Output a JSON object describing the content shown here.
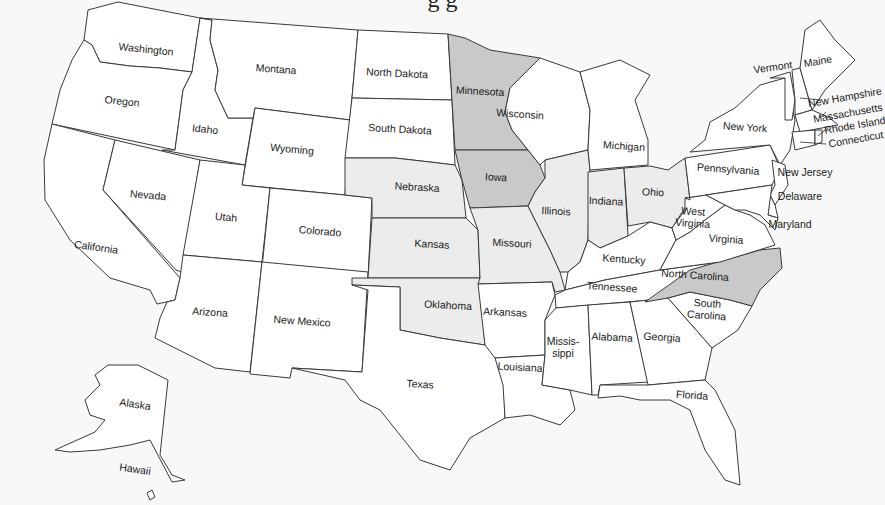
{
  "title_partial": "g                g",
  "legend_colors": {
    "none": "#ffffff",
    "light": "#ececec",
    "dark": "#c9c9c9",
    "background": "#f8f8f8",
    "border": "#3a3a3a"
  },
  "states": [
    {
      "id": "WA",
      "name": "Washington",
      "shade": "none",
      "lx": 146,
      "ly": 50,
      "rot": 6,
      "pts": "88,10 118,2 200,18 192,72 160,68 130,66 100,62 92,45 84,40"
    },
    {
      "id": "OR",
      "name": "Oregon",
      "shade": "none",
      "lx": 122,
      "ly": 102,
      "rot": 6,
      "pts": "84,40 92,45 100,62 130,66 160,68 192,72 183,90 175,150 52,124 60,90 72,60"
    },
    {
      "id": "CA",
      "name": "California",
      "shade": "none",
      "lx": 96,
      "ly": 248,
      "rot": 8,
      "pts": "52,124 115,140 103,190 180,278 175,300 157,304 150,290 110,278 70,240 45,200 44,160"
    },
    {
      "id": "ID",
      "name": "Idaho",
      "shade": "none",
      "lx": 205,
      "ly": 130,
      "rot": 6,
      "pts": "192,72 200,18 212,20 210,40 218,70 215,90 228,118 253,118 245,165 162,150 175,150 183,90"
    },
    {
      "id": "NV",
      "name": "Nevada",
      "shade": "none",
      "lx": 148,
      "ly": 196,
      "rot": 5,
      "pts": "115,140 200,160 182,272 176,270 103,190"
    },
    {
      "id": "MT",
      "name": "Montana",
      "shade": "none",
      "lx": 276,
      "ly": 70,
      "rot": 4,
      "pts": "200,18 358,30 350,120 255,108 253,118 228,118 215,90 218,70 210,40 212,20"
    },
    {
      "id": "WY",
      "name": "Wyoming",
      "shade": "none",
      "lx": 292,
      "ly": 150,
      "rot": 5,
      "pts": "255,108 350,120 345,195 242,185"
    },
    {
      "id": "UT",
      "name": "Utah",
      "shade": "none",
      "lx": 226,
      "ly": 218,
      "rot": 5,
      "pts": "200,160 245,165 242,185 270,188 262,262 183,255"
    },
    {
      "id": "CO",
      "name": "Colorado",
      "shade": "none",
      "lx": 320,
      "ly": 232,
      "rot": 5,
      "pts": "270,188 345,195 372,198 368,278 262,268"
    },
    {
      "id": "AZ",
      "name": "Arizona",
      "shade": "none",
      "lx": 210,
      "ly": 313,
      "rot": 4,
      "pts": "183,255 262,262 250,372 215,368 155,338 160,318 167,302 175,300 180,278"
    },
    {
      "id": "NM",
      "name": "New Mexico",
      "shade": "none",
      "lx": 302,
      "ly": 322,
      "rot": 4,
      "pts": "262,262 368,272 362,372 292,368 290,378 250,374"
    },
    {
      "id": "ND",
      "name": "North Dakota",
      "shade": "none",
      "lx": 397,
      "ly": 74,
      "rot": 3,
      "pts": "358,30 448,34 452,100 352,98"
    },
    {
      "id": "SD",
      "name": "South Dakota",
      "shade": "none",
      "lx": 400,
      "ly": 130,
      "rot": 3,
      "pts": "352,98 452,100 455,165 430,162 395,158 345,158"
    },
    {
      "id": "NE",
      "name": "Nebraska",
      "shade": "light",
      "lx": 417,
      "ly": 188,
      "rot": 3,
      "pts": "345,158 395,158 430,162 455,165 462,180 466,218 372,218 372,198 345,195"
    },
    {
      "id": "KS",
      "name": "Kansas",
      "shade": "light",
      "lx": 432,
      "ly": 245,
      "rot": 3,
      "pts": "372,218 466,218 478,230 480,278 368,278"
    },
    {
      "id": "OK",
      "name": "Oklahoma",
      "shade": "light",
      "lx": 448,
      "ly": 306,
      "rot": 3,
      "pts": "352,278 480,278 485,345 440,338 400,330 400,287 352,285"
    },
    {
      "id": "TX",
      "name": "Texas",
      "shade": "none",
      "lx": 420,
      "ly": 385,
      "rot": 3,
      "pts": "352,285 400,287 400,330 440,338 485,345 503,350 505,418 470,438 450,470 420,460 380,410 360,400 345,380 292,368 362,372 368,290"
    },
    {
      "id": "MN",
      "name": "Minnesota",
      "shade": "dark",
      "lx": 480,
      "ly": 92,
      "rot": 3,
      "pts": "448,34 465,38 490,50 540,58 510,88 505,112 512,130 528,150 455,150 452,100"
    },
    {
      "id": "IA",
      "name": "Iowa",
      "shade": "dark",
      "lx": 496,
      "ly": 178,
      "rot": 3,
      "pts": "455,150 528,150 540,165 545,178 535,192 528,206 470,208 462,180"
    },
    {
      "id": "MO",
      "name": "Missouri",
      "shade": "light",
      "lx": 512,
      "ly": 244,
      "rot": 3,
      "pts": "470,208 528,206 540,230 550,250 560,272 565,290 555,292 552,282 478,284 480,278 478,230"
    },
    {
      "id": "AR",
      "name": "Arkansas",
      "shade": "none",
      "lx": 505,
      "ly": 313,
      "rot": 3,
      "pts": "478,284 552,282 555,295 545,320 545,355 495,358 485,345"
    },
    {
      "id": "LA",
      "name": "Louisiana",
      "shade": "none",
      "lx": 520,
      "ly": 368,
      "rot": 3,
      "pts": "495,358 545,355 542,385 570,390 575,410 560,425 530,415 505,418 503,385"
    },
    {
      "id": "WI",
      "name": "Wisconsin",
      "shade": "none",
      "lx": 520,
      "ly": 115,
      "rot": 4,
      "pts": "510,88 540,58 580,72 590,110 588,150 545,160 540,165 528,150 512,130 505,112"
    },
    {
      "id": "IL",
      "name": "Illinois",
      "shade": "light",
      "lx": 556,
      "ly": 212,
      "rot": 3,
      "pts": "545,160 588,150 590,170 588,240 580,262 568,272 560,272 550,250 540,230 528,206 535,192 545,178"
    },
    {
      "id": "MI",
      "name": "Michigan",
      "shade": "none",
      "lx": 624,
      "ly": 147,
      "rot": 4,
      "pts": "580,72 620,60 650,75 635,100 648,140 648,165 590,170 588,150 590,110"
    },
    {
      "id": "IN",
      "name": "Indiana",
      "shade": "light",
      "lx": 606,
      "ly": 202,
      "rot": 3,
      "pts": "588,172 624,168 628,236 600,248 588,240"
    },
    {
      "id": "OH",
      "name": "Ohio",
      "shade": "light",
      "lx": 653,
      "ly": 193,
      "rot": 3,
      "pts": "624,168 650,166 668,170 685,158 690,200 672,228 650,222 628,226"
    },
    {
      "id": "KY",
      "name": "Kentucky",
      "shade": "none",
      "lx": 624,
      "ly": 260,
      "rot": 4,
      "pts": "588,240 600,248 628,236 650,222 672,228 676,240 660,270 605,280 565,290 568,272 580,262"
    },
    {
      "id": "TN",
      "name": "Tennessee",
      "shade": "none",
      "lx": 612,
      "ly": 288,
      "rot": 4,
      "pts": "565,290 605,280 660,270 720,262 690,285 650,300 556,308 555,295"
    },
    {
      "id": "MS",
      "name": "Mississippi",
      "shade": "none",
      "lx": 563,
      "ly": 348,
      "rot": 0,
      "pts": "556,308 588,305 592,395 570,390 542,385 545,355 545,320"
    },
    {
      "id": "AL",
      "name": "Alabama",
      "shade": "none",
      "lx": 612,
      "ly": 338,
      "rot": 3,
      "pts": "588,305 630,302 648,382 600,385 598,395 592,395"
    },
    {
      "id": "GA",
      "name": "Georgia",
      "shade": "none",
      "lx": 662,
      "ly": 338,
      "rot": 4,
      "pts": "630,302 668,298 712,348 705,380 648,385"
    },
    {
      "id": "FL",
      "name": "Florida",
      "shade": "none",
      "lx": 692,
      "ly": 396,
      "rot": 4,
      "pts": "600,385 648,385 705,380 715,390 735,430 740,485 725,480 705,450 690,410 670,400 640,400 620,396 598,398"
    },
    {
      "id": "SC",
      "name": "South Carolina",
      "shade": "none",
      "lx": 707,
      "ly": 310,
      "rot": 4,
      "pts": "668,298 690,292 730,300 752,306 738,330 712,348"
    },
    {
      "id": "NC",
      "name": "North Carolina",
      "shade": "dark",
      "lx": 695,
      "ly": 276,
      "rot": 4,
      "pts": "645,302 690,270 760,250 780,248 782,268 760,290 752,306 730,300 690,292 668,298"
    },
    {
      "id": "VA",
      "name": "Virginia",
      "shade": "none",
      "lx": 726,
      "ly": 240,
      "rot": 4,
      "pts": "660,270 676,240 690,232 705,220 725,205 735,210 750,215 765,225 775,245 720,262"
    },
    {
      "id": "WV",
      "name": "West Virginia",
      "shade": "none",
      "lx": 693,
      "ly": 218,
      "rot": 4,
      "pts": "676,240 672,228 685,210 685,198 706,195 725,205 705,220 690,232"
    },
    {
      "id": "PA",
      "name": "Pennsylvania",
      "shade": "none",
      "lx": 728,
      "ly": 170,
      "rot": 4,
      "pts": "685,158 770,145 780,168 772,185 706,195 685,198 690,200"
    },
    {
      "id": "NY",
      "name": "New York",
      "shade": "none",
      "lx": 745,
      "ly": 128,
      "rot": 4,
      "pts": "690,152 705,140 710,122 735,108 760,85 785,78 795,120 790,150 780,165 770,145"
    },
    {
      "id": "NJ",
      "name": "New Jersey",
      "shade": "none",
      "lx": 805,
      "ly": 173,
      "rot": 0,
      "pts": "772,160 785,165 788,185 775,205 770,195 775,185"
    },
    {
      "id": "DE",
      "name": "Delaware",
      "shade": "none",
      "lx": 800,
      "ly": 197,
      "rot": 0,
      "pts": "770,195 775,205 778,218 768,215"
    },
    {
      "id": "MD",
      "name": "Maryland",
      "shade": "none",
      "lx": 790,
      "ly": 225,
      "rot": 0,
      "pts": "706,195 772,185 768,215 778,218 775,230 760,215 745,210 735,210 725,205"
    },
    {
      "id": "VT",
      "name": "Vermont",
      "shade": "none",
      "lx": 773,
      "ly": 68,
      "rot": -8,
      "pts": "770,78 790,72 795,100 792,120 785,120 785,78"
    },
    {
      "id": "NH",
      "name": "New Hampshire",
      "shade": "none",
      "lx": 845,
      "ly": 98,
      "rot": -10,
      "pts": "792,70 800,68 812,110 795,115 795,100"
    },
    {
      "id": "ME",
      "name": "Maine",
      "shade": "none",
      "lx": 818,
      "ly": 62,
      "rot": -10,
      "pts": "800,68 805,30 820,20 835,40 855,60 840,75 825,90 812,110"
    },
    {
      "id": "MA",
      "name": "Massachusetts",
      "shade": "none",
      "lx": 848,
      "ly": 114,
      "rot": -10,
      "pts": "795,115 812,110 830,118 838,125 800,132"
    },
    {
      "id": "CT",
      "name": "Connecticut",
      "shade": "none",
      "lx": 856,
      "ly": 140,
      "rot": -10,
      "pts": "792,132 815,130 815,145 795,150"
    },
    {
      "id": "RI",
      "name": "Rhode Island",
      "shade": "none",
      "lx": 855,
      "ly": 126,
      "rot": -10,
      "pts": "815,130 822,130 822,142 815,145"
    },
    {
      "id": "AK",
      "name": "Alaska",
      "shade": "none",
      "lx": 135,
      "ly": 405,
      "rot": 8,
      "pts": "108,365 138,365 168,380 160,455 172,475 185,480 172,482 150,440 130,445 100,450 70,452 55,450 95,432 105,420 90,415 85,400 100,385 95,375"
    },
    {
      "id": "HI",
      "name": "Hawaii",
      "shade": "none",
      "lx": 135,
      "ly": 470,
      "rot": 8,
      "pts": "147,493 152,490 155,497 150,500"
    }
  ],
  "leaders": [
    {
      "for": "NH",
      "x1": 800,
      "y1": 98,
      "x2": 822,
      "y2": 100
    },
    {
      "for": "MA",
      "x1": 820,
      "y1": 118,
      "x2": 826,
      "y2": 112
    },
    {
      "for": "RI",
      "x1": 818,
      "y1": 136,
      "x2": 828,
      "y2": 128
    },
    {
      "for": "CT",
      "x1": 800,
      "y1": 142,
      "x2": 826,
      "y2": 144
    }
  ]
}
